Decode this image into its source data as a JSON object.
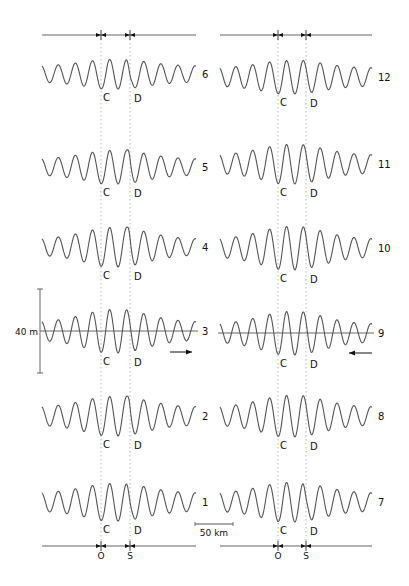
{
  "figure": {
    "width": 409,
    "height": 586,
    "line_color": "#555555",
    "ink_color": "#111111",
    "dotted_color": "#b8b8b8",
    "panels": [
      {
        "id": "left",
        "x_start": 42,
        "x_end": 196,
        "ref_lines_x": [
          101,
          130
        ],
        "top_axis": {
          "y": 35,
          "x_start": 42,
          "x_end": 196
        },
        "bottom_axis": {
          "y": 546,
          "x_start": 42,
          "x_end": 196,
          "tick_labels": [
            "O",
            "S"
          ]
        },
        "traces": [
          {
            "label": "6",
            "y": 74,
            "center_amp": 15,
            "edge_amp": 8,
            "twin_peak": true,
            "cusp": 0
          },
          {
            "label": "5",
            "y": 167,
            "center_amp": 17,
            "edge_amp": 8,
            "twin_peak": false,
            "cusp": 1
          },
          {
            "label": "4",
            "y": 247,
            "center_amp": 20,
            "edge_amp": 8,
            "twin_peak": false,
            "cusp": 1
          },
          {
            "label": "3",
            "y": 331,
            "center_amp": 22,
            "edge_amp": 9,
            "twin_peak": false,
            "cusp": 0
          },
          {
            "label": "2",
            "y": 416,
            "center_amp": 20,
            "edge_amp": 9,
            "twin_peak": false,
            "cusp": 1
          },
          {
            "label": "1",
            "y": 502,
            "center_amp": 19,
            "edge_amp": 9,
            "twin_peak": true,
            "cusp": 0
          }
        ]
      },
      {
        "id": "right",
        "x_start": 220,
        "x_end": 372,
        "ref_lines_x": [
          278,
          306
        ],
        "top_axis": {
          "y": 35,
          "x_start": 220,
          "x_end": 372
        },
        "bottom_axis": {
          "y": 546,
          "x_start": 220,
          "x_end": 372,
          "tick_labels": [
            "O",
            "S"
          ]
        },
        "traces": [
          {
            "label": "12",
            "y": 77,
            "center_amp": 17,
            "edge_amp": 9,
            "twin_peak": false,
            "cusp": 0
          },
          {
            "label": "11",
            "y": 164,
            "center_amp": 20,
            "edge_amp": 9,
            "twin_peak": false,
            "cusp": 0
          },
          {
            "label": "10",
            "y": 248,
            "center_amp": 22,
            "edge_amp": 9,
            "twin_peak": false,
            "cusp": 0
          },
          {
            "label": "9",
            "y": 333,
            "center_amp": 22,
            "edge_amp": 9,
            "twin_peak": false,
            "cusp": 0
          },
          {
            "label": "8",
            "y": 416,
            "center_amp": 21,
            "edge_amp": 9,
            "twin_peak": false,
            "cusp": 0
          },
          {
            "label": "7",
            "y": 502,
            "center_amp": 20,
            "edge_amp": 9,
            "twin_peak": true,
            "cusp": 0
          }
        ]
      }
    ],
    "marker_labels": {
      "c": "C",
      "d": "D"
    },
    "vertical_scale": {
      "label": "40 m",
      "x": 40,
      "y_top": 289,
      "y_bottom": 373
    },
    "horizontal_scale": {
      "label": "50 km",
      "x_start": 195,
      "x_end": 233,
      "y": 524
    },
    "arrows": [
      {
        "name": "direction-arrow-right",
        "panel": "left",
        "trace": "3",
        "x_from": 170,
        "x_to": 192,
        "y": 352
      },
      {
        "name": "direction-arrow-left",
        "panel": "right",
        "trace": "9",
        "x_from": 372,
        "x_to": 349,
        "y": 353
      }
    ],
    "zero_lines": [
      {
        "panel": "left",
        "trace": "3",
        "y": 331
      },
      {
        "panel": "right",
        "trace": "9",
        "y": 333
      }
    ]
  }
}
